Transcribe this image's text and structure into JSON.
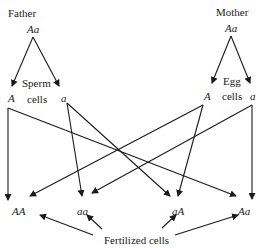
{
  "father": {
    "label": "Father",
    "genotype": "Aa",
    "gamete_label_line1": "Sperm",
    "gamete_label_line2": "cells",
    "gametes": [
      "A",
      "a"
    ]
  },
  "mother": {
    "label": "Mother",
    "genotype": "Aa",
    "gamete_label_line1": "Egg",
    "gamete_label_line2": "cells",
    "gametes": [
      "A",
      "a"
    ]
  },
  "offspring": {
    "genotypes": [
      "AA",
      "aa",
      "aA",
      "Aa"
    ],
    "label": "Fertilized cells"
  },
  "connections": [
    {
      "from": "father.A",
      "to": "AA"
    },
    {
      "from": "father.A",
      "to": "Aa"
    },
    {
      "from": "father.a",
      "to": "aa"
    },
    {
      "from": "father.a",
      "to": "aA"
    },
    {
      "from": "mother.A",
      "to": "AA"
    },
    {
      "from": "mother.A",
      "to": "aA"
    },
    {
      "from": "mother.a",
      "to": "aa"
    },
    {
      "from": "mother.a",
      "to": "Aa"
    }
  ],
  "colors": {
    "ink": "#1a1a1a",
    "background": "#ffffff"
  }
}
